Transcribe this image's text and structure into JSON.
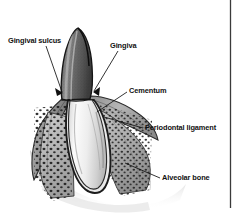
{
  "figure": {
    "type": "grayscale-line-illustration",
    "colors": {
      "background": "#ffffff",
      "ink": "#111111",
      "enamel_shade": "#6e6e6e",
      "root_shade": "#f2f2f2",
      "bone_shade": "#b4b4b4",
      "gingiva_shade": "#9a9a9a",
      "border_rule": "#3a3a3a"
    },
    "labels": [
      {
        "id": "gingival_sulcus",
        "text": "Gingival sulcus"
      },
      {
        "id": "gingiva",
        "text": "Gingiva"
      },
      {
        "id": "cementum",
        "text": "Cementum"
      },
      {
        "id": "periodontal_ligament",
        "text": "Periodontal ligament"
      },
      {
        "id": "alveolar_bone",
        "text": "Alveolar bone"
      }
    ]
  }
}
